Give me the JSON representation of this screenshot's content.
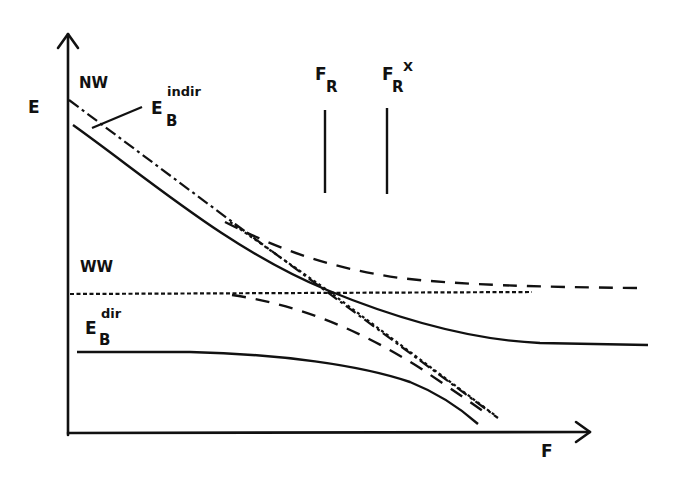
{
  "diagram": {
    "type": "energy-vs-field level diagram",
    "axes": {
      "y_label": "E",
      "x_label": "F"
    },
    "labels": {
      "nw": "NW",
      "ww": "WW",
      "eb_indir": {
        "base": "E",
        "sub": "B",
        "sup": "indir"
      },
      "eb_dir": {
        "base": "E",
        "sub": "B",
        "sup": "dir"
      },
      "fr": {
        "base": "F",
        "sub": "R"
      },
      "fr_x": {
        "base": "F",
        "sub": "R",
        "sup": "X"
      }
    },
    "markers": [
      {
        "name": "F_R",
        "x": 325
      },
      {
        "name": "F_R^X",
        "x": 387
      }
    ],
    "curves": [
      {
        "name": "nw-diabatic-dashdot",
        "style": "dash-dot"
      },
      {
        "name": "nw-diabatic-dotted",
        "style": "dotted"
      },
      {
        "name": "ww-level-dotted",
        "style": "dotted"
      },
      {
        "name": "upper-adiabatic-solid",
        "style": "solid"
      },
      {
        "name": "upper-dashed",
        "style": "dashed"
      },
      {
        "name": "lower-dashed",
        "style": "dashed"
      },
      {
        "name": "lower-solid-eb-dir",
        "style": "solid"
      }
    ],
    "colors": {
      "ink": "#111111",
      "background": "#ffffff"
    }
  }
}
